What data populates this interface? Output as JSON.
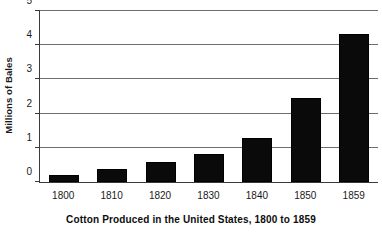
{
  "chart_data": {
    "type": "bar",
    "title": "",
    "caption": "Cotton Produced in the United States, 1800 to 1859",
    "xlabel": "",
    "ylabel": "Millions of Bales",
    "categories": [
      "1800",
      "1810",
      "1820",
      "1830",
      "1840",
      "1850",
      "1859"
    ],
    "values": [
      0.2,
      0.38,
      0.58,
      0.82,
      1.28,
      2.45,
      4.32
    ],
    "ylim": [
      0,
      5
    ],
    "yticks": [
      "0",
      "1",
      "2",
      "3",
      "4",
      "5"
    ],
    "ytick_values": [
      0,
      1,
      2,
      3,
      4,
      5
    ],
    "grid": "horizontal",
    "legend": "none",
    "series": [
      {
        "name": "Cotton Production",
        "values": [
          0.2,
          0.38,
          0.58,
          0.82,
          1.28,
          2.45,
          4.32
        ]
      }
    ],
    "colors": {
      "bar": "#0a0a0a",
      "gridline": "#6e6e6e",
      "axis": "#3a3a3a",
      "background": "#ffffff",
      "text": "#1a1a1a"
    }
  }
}
